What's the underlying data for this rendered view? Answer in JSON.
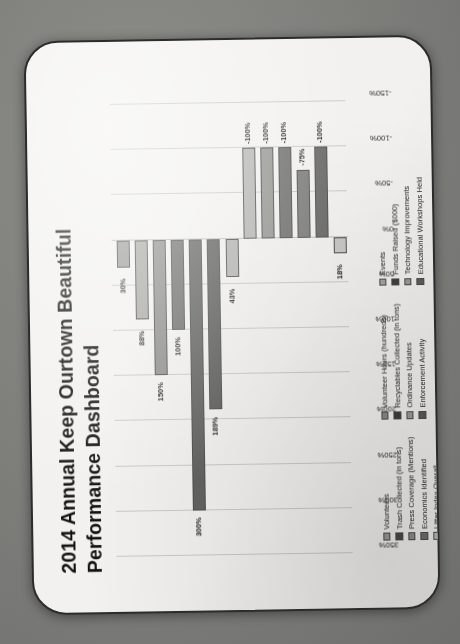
{
  "slide": {
    "title": "2014 Annual Keep Ourtown Beautiful Performance Dashboard"
  },
  "chart_data": {
    "type": "bar",
    "orientation": "vertical",
    "title": "2014 Annual Keep Ourtown Beautiful Performance Dashboard",
    "xlabel": "",
    "ylabel": "",
    "ylim": [
      -150,
      350
    ],
    "grid": true,
    "legend_position": "bottom",
    "tick_labels": [
      "350%",
      "300%",
      "250%",
      "200%",
      "150%",
      "100%",
      "50%",
      "0%",
      "-50%",
      "-100%",
      "-150%"
    ],
    "tick_values": [
      350,
      300,
      250,
      200,
      150,
      100,
      50,
      0,
      -50,
      -100,
      -150
    ],
    "categories": [
      "Volunteers",
      "Trash Collected (in tons)",
      "Press Coverage (Mentions)",
      "Economics Identified",
      "Litter Index Overall",
      "Volunteer Hours (hundreds)",
      "Recyclables Collected (in tons)",
      "Ordinance Updates",
      "Enforcement Activity",
      "Events",
      "Funds Raised ($000)",
      "Technology Improvements",
      "Educational Workshops Held"
    ],
    "values": [
      30,
      88,
      150,
      100,
      300,
      189,
      43,
      -100,
      -100,
      -100,
      -75,
      -100,
      18
    ],
    "data_labels": [
      "30%",
      "88%",
      "150%",
      "100%",
      "300%",
      "189%",
      "43%",
      "-100%",
      "-100%",
      "-100%",
      "-75%",
      "-100%",
      "18%"
    ],
    "bar_colors": [
      "#9a9a98",
      "#a8a8a3",
      "#8f8f8c",
      "#6f6f6d",
      "#636361",
      "#5f5f5d",
      "#b4b4b0",
      "#b6b6b1",
      "#979793",
      "#72726f",
      "#7e7e7b",
      "#6b6b69",
      "#c7c7c3"
    ]
  },
  "legend": {
    "columns": [
      {
        "items": [
          {
            "label": "Volunteers",
            "color": "#9a9a98"
          },
          {
            "label": "Trash Collected (in tons)",
            "color": "#4a4a48"
          },
          {
            "label": "Press Coverage (Mentions)",
            "color": "#8f8f8c"
          },
          {
            "label": "Economics Identified",
            "color": "#6f6f6d"
          },
          {
            "label": "Litter Index Overall",
            "color": "#c0c0bc"
          }
        ]
      },
      {
        "items": [
          {
            "label": "Volunteer Hours (hundreds)",
            "color": "#8a8a87"
          },
          {
            "label": "Recyclables Collected (in tons)",
            "color": "#3d3d3b"
          },
          {
            "label": "Ordinance Updates",
            "color": "#9c9c99"
          },
          {
            "label": "Enforcement Activity",
            "color": "#5a5a58"
          }
        ]
      },
      {
        "items": [
          {
            "label": "Events",
            "color": "#a4a4a1"
          },
          {
            "label": "Funds Raised ($000)",
            "color": "#3f3f3d"
          },
          {
            "label": "Technology Improvements",
            "color": "#9a9a97"
          },
          {
            "label": "Educational Workshops Held",
            "color": "#5d5d5b"
          }
        ]
      }
    ]
  }
}
